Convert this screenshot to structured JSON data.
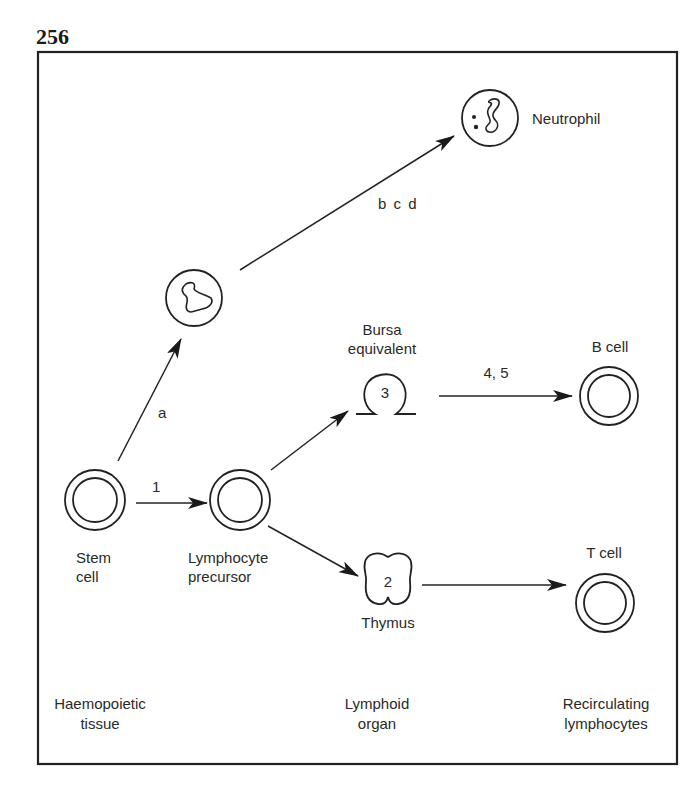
{
  "figure": {
    "number": "256"
  },
  "nodes": {
    "neutrophil": {
      "label": "Neutrophil"
    },
    "myeloid_intermediate": {
      "label": ""
    },
    "stem_cell": {
      "label_line1": "Stem",
      "label_line2": "cell"
    },
    "lymphocyte_precursor": {
      "label_line1": "Lymphocyte",
      "label_line2": "precursor"
    },
    "bursa": {
      "label_line1": "Bursa",
      "label_line2": "equivalent",
      "number": "3"
    },
    "thymus": {
      "label": "Thymus",
      "number": "2"
    },
    "b_cell": {
      "label": "B cell"
    },
    "t_cell": {
      "label": "T cell"
    }
  },
  "edges": {
    "stem_to_myeloid": {
      "label": "a"
    },
    "myeloid_to_neutrophil": {
      "label": "b c d"
    },
    "stem_to_precursor": {
      "label": "1"
    },
    "bursa_to_bcell": {
      "label": "4, 5"
    },
    "precursor_to_bursa": {
      "label": ""
    },
    "precursor_to_thymus": {
      "label": ""
    },
    "thymus_to_tcell": {
      "label": ""
    }
  },
  "columns": {
    "left": {
      "line1": "Haemopoietic",
      "line2": "tissue"
    },
    "middle": {
      "line1": "Lymphoid",
      "line2": "organ"
    },
    "right": {
      "line1": "Recirculating",
      "line2": "lymphocytes"
    }
  }
}
